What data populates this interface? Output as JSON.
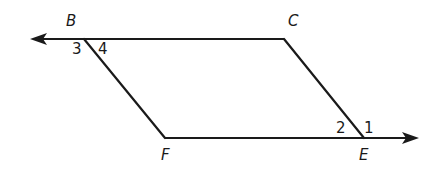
{
  "figure": {
    "type": "parallelogram-with-extended-rays",
    "stroke_color": "#1a1a1a",
    "background": "#ffffff",
    "vertices": {
      "B": {
        "label": "B",
        "x": 84,
        "y": 39
      },
      "C": {
        "label": "C",
        "x": 284,
        "y": 39
      },
      "E": {
        "label": "E",
        "x": 364,
        "y": 138
      },
      "F": {
        "label": "F",
        "x": 165,
        "y": 138
      }
    },
    "rays": [
      {
        "name": "ray-CB-extended-left",
        "from": "C",
        "through": "B",
        "arrow_tip": {
          "x": 30,
          "y": 39
        }
      },
      {
        "name": "ray-FE-extended-right",
        "from": "F",
        "through": "E",
        "arrow_tip": {
          "x": 419,
          "y": 138
        }
      }
    ],
    "segments": [
      {
        "name": "segment-BF",
        "from": "B",
        "to": "F"
      },
      {
        "name": "segment-CE",
        "from": "C",
        "to": "E"
      }
    ],
    "angle_labels": {
      "a1": {
        "label": "1",
        "near": "E",
        "position": "right of EC, above ray"
      },
      "a2": {
        "label": "2",
        "near": "E",
        "position": "left of EC, above line"
      },
      "a3": {
        "label": "3",
        "near": "B",
        "position": "left of BF, below ray"
      },
      "a4": {
        "label": "4",
        "near": "B",
        "position": "right of BF, below line"
      }
    }
  }
}
